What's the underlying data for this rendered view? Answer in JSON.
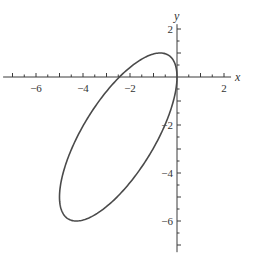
{
  "chart_data": {
    "type": "line",
    "title": "",
    "xlabel": "x",
    "ylabel": "y",
    "xlim": [
      -7.4,
      2.3
    ],
    "ylim": [
      -7.3,
      2.2
    ],
    "grid": false,
    "legend": null,
    "x_ticks": [
      -6,
      -4,
      -2,
      2
    ],
    "x_tick_labels": [
      "−6",
      "−4",
      "−2",
      "2"
    ],
    "x_minor_step": 0.5,
    "y_ticks": [
      2,
      -2,
      -4,
      -6
    ],
    "y_tick_labels": [
      "2",
      "−2",
      "−4",
      "−6"
    ],
    "y_minor_step": 0.5,
    "series": [
      {
        "name": "ellipse",
        "shape": "ellipse",
        "parametric": "x = -2.5 + 2.5 cos t, y = -2.5 + 3.5 cos(t + 44.4°)",
        "center": [
          -2.5,
          -2.5
        ],
        "x_amplitude": 2.5,
        "y_amplitude": 3.5,
        "phase_deg": 44.4,
        "color": "#4a4a4a",
        "key_points": {
          "top": [
            -0.75,
            1.0
          ],
          "bottom": [
            -4.3,
            -6.0
          ],
          "leftmost": [
            -5.0,
            -4.9
          ],
          "rightmost": [
            0.0,
            0.0
          ],
          "x_axis_crossings": [
            -2.45,
            0.0
          ]
        }
      }
    ]
  },
  "layout": {
    "origin_px": [
      177,
      77
    ],
    "px_per_unit_x": 23.5,
    "px_per_unit_y": 24
  }
}
